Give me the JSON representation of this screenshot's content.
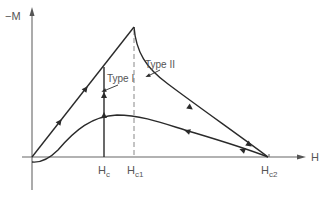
{
  "diagram": {
    "type": "magnetization-curve",
    "axes": {
      "y_label": "−M",
      "x_label": "H"
    },
    "x_ticks": {
      "hc": {
        "main": "H",
        "sub": "c"
      },
      "hc1": {
        "main": "H",
        "sub": "c1"
      },
      "hc2": {
        "main": "H",
        "sub": "c2"
      }
    },
    "annotations": {
      "type1": "Type I",
      "type2": "Type II"
    },
    "colors": {
      "curve": "#2a2a2a",
      "axis": "#666666",
      "dashed": "#888888",
      "text": "#555555",
      "background": "#ffffff"
    }
  }
}
